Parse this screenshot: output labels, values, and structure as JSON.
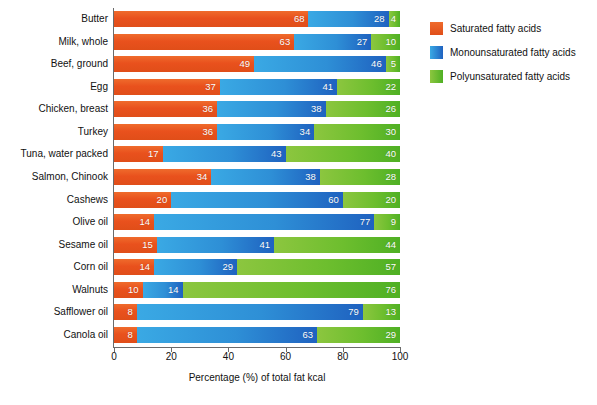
{
  "chart_data": {
    "type": "bar",
    "orientation": "horizontal",
    "stacked": true,
    "title": "",
    "xlabel": "Percentage (%) of total fat kcal",
    "ylabel": "",
    "xlim": [
      0,
      100
    ],
    "xticks": [
      0,
      20,
      40,
      60,
      80,
      100
    ],
    "grid": false,
    "legend_position": "right",
    "categories": [
      "Butter",
      "Milk, whole",
      "Beef, ground",
      "Egg",
      "Chicken, breast",
      "Turkey",
      "Tuna, water packed",
      "Salmon, Chinook",
      "Cashews",
      "Olive oil",
      "Sesame oil",
      "Corn oil",
      "Walnuts",
      "Safflower oil",
      "Canola oil"
    ],
    "series": [
      {
        "name": "Saturated fatty acids",
        "color": "#e9511d",
        "values": [
          68,
          63,
          49,
          37,
          36,
          36,
          17,
          34,
          20,
          14,
          15,
          14,
          10,
          8,
          8
        ]
      },
      {
        "name": "Monounsaturated fatty acids",
        "color": "#2e8fd6",
        "values": [
          28,
          27,
          46,
          41,
          38,
          34,
          43,
          38,
          60,
          77,
          41,
          29,
          14,
          79,
          63
        ]
      },
      {
        "name": "Polyunsaturated fatty acids",
        "color": "#6dbe2e",
        "values": [
          4,
          10,
          5,
          22,
          26,
          30,
          40,
          28,
          20,
          9,
          44,
          57,
          76,
          13,
          29
        ]
      }
    ]
  },
  "legend": {
    "items": [
      {
        "label": "Saturated fatty acids",
        "swatch": "sat"
      },
      {
        "label": "Monounsaturated fatty acids",
        "swatch": "mono"
      },
      {
        "label": "Polyunsaturated fatty acids",
        "swatch": "poly"
      }
    ]
  },
  "axis": {
    "x_title": "Percentage (%) of total fat kcal",
    "x_tick_labels": [
      "0",
      "20",
      "40",
      "60",
      "80",
      "100"
    ]
  }
}
